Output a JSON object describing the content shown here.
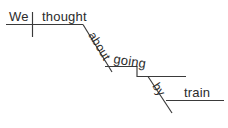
{
  "diagram": {
    "kind": "reed-kellogg-sentence-diagram",
    "sentence": "We thought about going by train.",
    "ink_color": "#3a3a3a",
    "text_color": "#2b2b2b",
    "background_color": "#ffffff",
    "words": {
      "subject": "We",
      "verb": "thought",
      "preposition_1": "about",
      "gerund": "going",
      "preposition_2": "by",
      "object_of_preposition_2": "train"
    },
    "labels": {
      "subject_role": "subject",
      "verb_role": "verb",
      "preposition_1_role": "preposition",
      "gerund_role": "gerund",
      "preposition_2_role": "preposition",
      "object_role": "object of preposition"
    }
  }
}
